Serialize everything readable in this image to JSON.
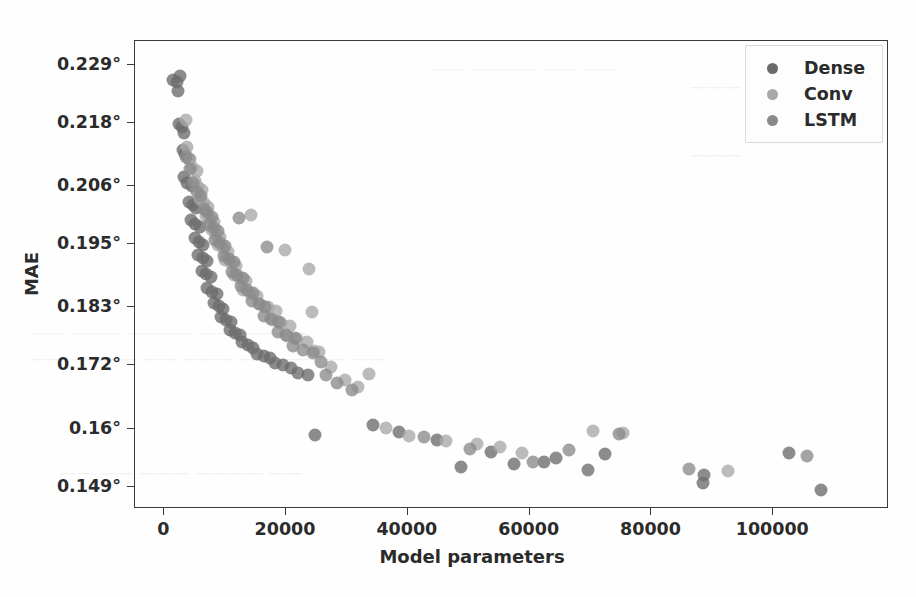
{
  "chart_data": {
    "type": "scatter",
    "title": "",
    "xlabel": "Model parameters",
    "ylabel": "MAE",
    "xlim": [
      -4800,
      119000
    ],
    "ylim": [
      0.1448,
      0.2335
    ],
    "grid": false,
    "legend_position": "upper right",
    "xticks": [
      0,
      20000,
      40000,
      60000,
      80000,
      100000
    ],
    "xtick_labels": [
      "0",
      "20000",
      "40000",
      "60000",
      "80000",
      "100000"
    ],
    "yticks": [
      0.229,
      0.218,
      0.206,
      0.195,
      0.183,
      0.172,
      0.16,
      0.149
    ],
    "ytick_labels": [
      "0.229°",
      "0.218°",
      "0.206°",
      "0.195°",
      "0.183°",
      "0.172°",
      "0.16°",
      "0.149°"
    ],
    "marker_size": 13,
    "marker_opacity": 0.78,
    "series": [
      {
        "name": "Dense",
        "color": "#6b6b6b",
        "points": [
          [
            1500,
            0.2262
          ],
          [
            2100,
            0.2258
          ],
          [
            2600,
            0.2268
          ],
          [
            2200,
            0.224
          ],
          [
            2400,
            0.2178
          ],
          [
            2900,
            0.2172
          ],
          [
            3200,
            0.216
          ],
          [
            3000,
            0.2128
          ],
          [
            3400,
            0.212
          ],
          [
            4100,
            0.2112
          ],
          [
            3300,
            0.2078
          ],
          [
            3800,
            0.2065
          ],
          [
            4500,
            0.206
          ],
          [
            4000,
            0.203
          ],
          [
            4700,
            0.2024
          ],
          [
            5200,
            0.2018
          ],
          [
            4400,
            0.1996
          ],
          [
            5100,
            0.1988
          ],
          [
            5800,
            0.1982
          ],
          [
            5000,
            0.1962
          ],
          [
            5700,
            0.1955
          ],
          [
            6400,
            0.1948
          ],
          [
            5600,
            0.193
          ],
          [
            6300,
            0.1924
          ],
          [
            7000,
            0.1918
          ],
          [
            6200,
            0.19
          ],
          [
            6900,
            0.1894
          ],
          [
            7700,
            0.1888
          ],
          [
            7100,
            0.1866
          ],
          [
            7900,
            0.186
          ],
          [
            8600,
            0.1856
          ],
          [
            8200,
            0.1838
          ],
          [
            9000,
            0.1832
          ],
          [
            9700,
            0.1828
          ],
          [
            9400,
            0.1812
          ],
          [
            10200,
            0.1806
          ],
          [
            11000,
            0.1802
          ],
          [
            10800,
            0.1788
          ],
          [
            11600,
            0.1782
          ],
          [
            12400,
            0.1778
          ],
          [
            12800,
            0.1764
          ],
          [
            13700,
            0.1758
          ],
          [
            14600,
            0.1754
          ],
          [
            15200,
            0.1742
          ],
          [
            16300,
            0.1738
          ],
          [
            17400,
            0.1734
          ],
          [
            18200,
            0.1724
          ],
          [
            19500,
            0.172
          ],
          [
            20800,
            0.1716
          ],
          [
            22000,
            0.1706
          ],
          [
            23600,
            0.1702
          ],
          [
            24800,
            0.1588
          ],
          [
            34200,
            0.1608
          ],
          [
            38600,
            0.1594
          ],
          [
            44800,
            0.1578
          ],
          [
            48800,
            0.1528
          ],
          [
            53600,
            0.1556
          ],
          [
            57400,
            0.1534
          ],
          [
            62300,
            0.1538
          ],
          [
            64400,
            0.1544
          ],
          [
            69600,
            0.1522
          ],
          [
            72300,
            0.1552
          ],
          [
            88400,
            0.1498
          ],
          [
            88600,
            0.1512
          ],
          [
            102600,
            0.1554
          ],
          [
            107800,
            0.1484
          ]
        ]
      },
      {
        "name": "Conv",
        "color": "#a8a8a8",
        "points": [
          [
            3600,
            0.2186
          ],
          [
            3800,
            0.2134
          ],
          [
            4200,
            0.2112
          ],
          [
            4600,
            0.2096
          ],
          [
            5300,
            0.2088
          ],
          [
            5000,
            0.207
          ],
          [
            5600,
            0.2058
          ],
          [
            6200,
            0.2052
          ],
          [
            5900,
            0.2036
          ],
          [
            6600,
            0.2028
          ],
          [
            7200,
            0.202
          ],
          [
            6800,
            0.2004
          ],
          [
            7500,
            0.1998
          ],
          [
            8200,
            0.1992
          ],
          [
            7800,
            0.1976
          ],
          [
            8500,
            0.197
          ],
          [
            9200,
            0.1964
          ],
          [
            8800,
            0.1948
          ],
          [
            9600,
            0.1942
          ],
          [
            10400,
            0.1936
          ],
          [
            10000,
            0.192
          ],
          [
            10900,
            0.1914
          ],
          [
            11800,
            0.1908
          ],
          [
            11400,
            0.1892
          ],
          [
            12400,
            0.1886
          ],
          [
            13400,
            0.188
          ],
          [
            13000,
            0.1864
          ],
          [
            14100,
            0.1858
          ],
          [
            15200,
            0.1852
          ],
          [
            15800,
            0.1836
          ],
          [
            17000,
            0.183
          ],
          [
            18300,
            0.1824
          ],
          [
            17800,
            0.1806
          ],
          [
            19200,
            0.18
          ],
          [
            20600,
            0.1794
          ],
          [
            20200,
            0.1776
          ],
          [
            21800,
            0.177
          ],
          [
            23400,
            0.1764
          ],
          [
            14200,
            0.2006
          ],
          [
            19800,
            0.1938
          ],
          [
            23800,
            0.1902
          ],
          [
            24200,
            0.1822
          ],
          [
            24600,
            0.1748
          ],
          [
            25400,
            0.1746
          ],
          [
            27400,
            0.1718
          ],
          [
            29600,
            0.1692
          ],
          [
            31800,
            0.168
          ],
          [
            33600,
            0.1704
          ],
          [
            36400,
            0.1602
          ],
          [
            40200,
            0.1586
          ],
          [
            46200,
            0.1576
          ],
          [
            51400,
            0.1572
          ],
          [
            55200,
            0.1566
          ],
          [
            58800,
            0.1554
          ],
          [
            70400,
            0.1596
          ],
          [
            75400,
            0.1592
          ],
          [
            92600,
            0.152
          ]
        ]
      },
      {
        "name": "LSTM",
        "color": "#8a8a8a",
        "points": [
          [
            3500,
            0.2116
          ],
          [
            4300,
            0.2092
          ],
          [
            4800,
            0.2066
          ],
          [
            5400,
            0.2048
          ],
          [
            6000,
            0.2042
          ],
          [
            6500,
            0.2016
          ],
          [
            7100,
            0.201
          ],
          [
            7800,
            0.2002
          ],
          [
            7400,
            0.1986
          ],
          [
            8100,
            0.198
          ],
          [
            8800,
            0.1974
          ],
          [
            8400,
            0.1958
          ],
          [
            9200,
            0.1952
          ],
          [
            10000,
            0.1946
          ],
          [
            9800,
            0.1928
          ],
          [
            10600,
            0.1922
          ],
          [
            11400,
            0.1916
          ],
          [
            11200,
            0.1898
          ],
          [
            12000,
            0.1892
          ],
          [
            12900,
            0.1886
          ],
          [
            12600,
            0.187
          ],
          [
            13600,
            0.1864
          ],
          [
            14600,
            0.1858
          ],
          [
            14400,
            0.1842
          ],
          [
            15500,
            0.1836
          ],
          [
            16600,
            0.183
          ],
          [
            16400,
            0.1814
          ],
          [
            17600,
            0.1808
          ],
          [
            18800,
            0.1802
          ],
          [
            18600,
            0.1784
          ],
          [
            20000,
            0.1778
          ],
          [
            21400,
            0.1772
          ],
          [
            21200,
            0.1756
          ],
          [
            22800,
            0.175
          ],
          [
            24400,
            0.1744
          ],
          [
            12200,
            0.2
          ],
          [
            16800,
            0.1944
          ],
          [
            25800,
            0.1726
          ],
          [
            26600,
            0.1702
          ],
          [
            28400,
            0.1686
          ],
          [
            30800,
            0.1674
          ],
          [
            42600,
            0.1584
          ],
          [
            50200,
            0.1562
          ],
          [
            60600,
            0.1538
          ],
          [
            66400,
            0.156
          ],
          [
            74600,
            0.159
          ],
          [
            86200,
            0.1524
          ],
          [
            105600,
            0.1548
          ]
        ]
      }
    ]
  },
  "legend": {
    "items": [
      {
        "label": "Dense",
        "color": "#6b6b6b"
      },
      {
        "label": "Conv",
        "color": "#a8a8a8"
      },
      {
        "label": "LSTM",
        "color": "#8a8a8a"
      }
    ]
  },
  "bleed_through": [
    {
      "text": "—— ———— —— ——",
      "x": 430,
      "y": 58
    },
    {
      "text": "——— ——",
      "x": 690,
      "y": 76
    },
    {
      "text": "———",
      "x": 690,
      "y": 144
    },
    {
      "text": "—— ——— ———— —— ————",
      "x": 30,
      "y": 322
    },
    {
      "text": "—— ———— —— ——— —— ———— ——",
      "x": 30,
      "y": 348
    },
    {
      "text": "—— —— ——— ———— ——",
      "x": 60,
      "y": 462
    }
  ]
}
